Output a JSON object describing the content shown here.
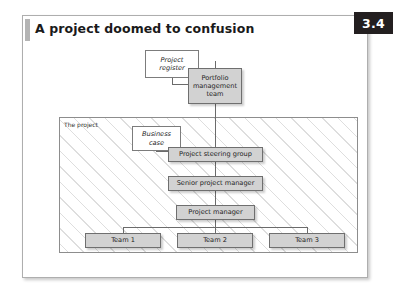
{
  "figure": {
    "number": "3.4",
    "title": "A project doomed to confusion"
  },
  "diagram": {
    "region_label": "The project",
    "nodes": {
      "project_register": "Project\nregister",
      "project_register_line1": "Project",
      "project_register_line2": "register",
      "portfolio_line1": "Portfolio",
      "portfolio_line2": "management",
      "portfolio_line3": "team",
      "business_case_line1": "Business",
      "business_case_line2": "case",
      "steering_group": "Project steering group",
      "senior_project_manager": "Senior project manager",
      "project_manager": "Project manager",
      "team_1": "Team 1",
      "team_2": "Team 2",
      "team_3": "Team 3"
    }
  },
  "colors": {
    "badge_background": "#231f20",
    "badge_text": "#ffffff",
    "node_gray_fill": "#d2d2d2",
    "node_border": "#6f6f6f",
    "frame_border": "#aeaeae",
    "hatch_line": "#dedede",
    "title_accent": "#b4b4b4"
  }
}
